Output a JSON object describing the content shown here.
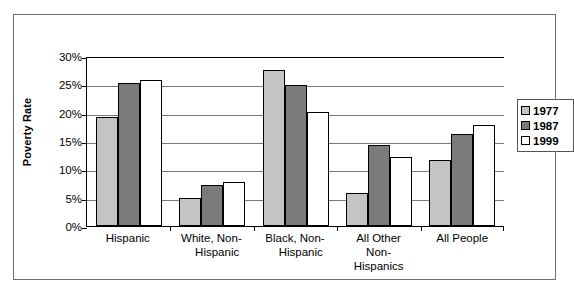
{
  "chart_data": {
    "type": "bar",
    "title": "",
    "xlabel": "",
    "ylabel": "Poverty Rate",
    "ylim": [
      0,
      30
    ],
    "ytick_step": 5,
    "ytick_labels": [
      "0%",
      "5%",
      "10%",
      "15%",
      "20%",
      "25%",
      "30%"
    ],
    "ytick_values": [
      0,
      5,
      10,
      15,
      20,
      25,
      30
    ],
    "grid": true,
    "legend_position": "right",
    "categories": [
      "Hispanic",
      "White, Non-Hispanic",
      "Black, Non-Hispanic",
      "All Other Non-Hispanics",
      "All People"
    ],
    "category_label_lines": [
      [
        "Hispanic"
      ],
      [
        "White, Non-",
        "Hispanic"
      ],
      [
        "Black, Non-",
        "Hispanic"
      ],
      [
        "All Other",
        "Non-",
        "Hispanics"
      ],
      [
        "All People"
      ]
    ],
    "series": [
      {
        "name": "1977",
        "color": "#c4c4c4",
        "values": [
          19.3,
          4.9,
          27.5,
          5.8,
          11.6
        ]
      },
      {
        "name": "1987",
        "color": "#7b7b7b",
        "values": [
          25.2,
          7.2,
          24.9,
          14.3,
          16.2
        ]
      },
      {
        "name": "1999",
        "color": "#ffffff",
        "values": [
          25.7,
          7.8,
          20.1,
          12.1,
          17.8
        ]
      }
    ],
    "legend_entries": [
      "1977",
      "1987",
      "1999"
    ]
  }
}
